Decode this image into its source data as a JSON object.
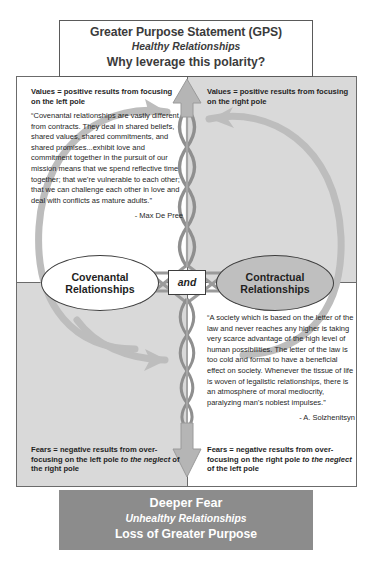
{
  "gps": {
    "title": "Greater Purpose Statement (GPS)",
    "subtitle": "Healthy Relationships",
    "question": "Why leverage this polarity?"
  },
  "quadrants": {
    "upper_left_label": "Values = positive results from focusing on the left pole",
    "upper_right_label": "Values = positive results from focusing on the right pole",
    "lower_left_label_a": "Fears = negative results from over-focusing on the left pole ",
    "lower_left_label_em": "to the neglect",
    "lower_left_label_b": " of the right pole",
    "lower_right_label_a": "Fears = negative results from over-focusing on the right pole ",
    "lower_right_label_em": "to the neglect",
    "lower_right_label_b": " of the left pole"
  },
  "poles": {
    "left": "Covenantal Relationships",
    "right": "Contractual Relationships",
    "connector": "and"
  },
  "quotes": {
    "left": {
      "text": "“Covenantal relationships are vastly different from contracts. They deal in shared beliefs, shared values, shared commitments, and shared promises...exhibit love and commitment together in the pursuit of our mission means that we spend reflective time together; that we’re vulnerable to each other; that we can challenge each other in love and deal with conflicts as mature adults.”",
      "attribution": "- Max De Pree"
    },
    "right": {
      "text": "“A society which is based on the letter of the law and never reaches any higher is taking very scarce advantage of the high level of human possibilities. The letter of the law is too cold and formal to have a beneficial effect on society. Whenever the tissue of life is woven of legalistic relationships, there is an atmosphere of moral mediocrity, paralyzing man’s noblest impulses.”",
      "attribution": "- A. Solzhenitsyn"
    }
  },
  "deeper_fear": {
    "title": "Deeper Fear",
    "subtitle": "Unhealthy Relationships",
    "loss": "Loss of Greater Purpose"
  },
  "colors": {
    "quadrant_shaded": "#d9d9d9",
    "quadrant_light": "#ffffff",
    "pole_right_fill": "#bfbfbf",
    "deeper_fear_fill": "#8c8c8c",
    "loop_stroke": "#b3b3b3",
    "helix_stroke": "#8f8f8f",
    "frame_stroke": "#6b6b6b"
  }
}
